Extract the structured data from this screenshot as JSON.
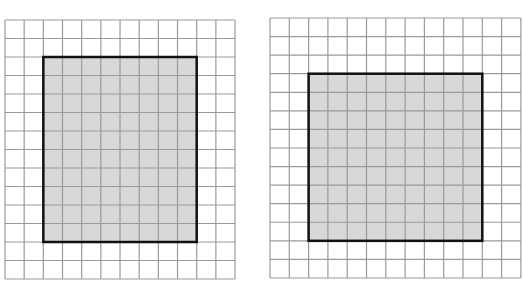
{
  "colors": {
    "grid_line": "#9a9a9a",
    "shade_fill": "#d8d8d8",
    "outline": "#111111",
    "background": "#ffffff"
  },
  "figures": [
    {
      "name": "left-grid",
      "x": 5,
      "y": 20,
      "cols": 12,
      "rows": 14,
      "cell_w": 19.17,
      "cell_h": 18.5,
      "rect": {
        "col": 2,
        "row": 2,
        "cols": 8,
        "rows": 10
      },
      "label": "Shaded rectangle 8 by 10 units on a 12 by 14 grid"
    },
    {
      "name": "right-grid",
      "x": 270,
      "y": 18,
      "cols": 13,
      "rows": 14,
      "cell_w": 19.3,
      "cell_h": 18.57,
      "rect": {
        "col": 2,
        "row": 3,
        "cols": 9,
        "rows": 9
      },
      "label": "Shaded square 9 by 9 units on a 13 by 14 grid"
    }
  ]
}
